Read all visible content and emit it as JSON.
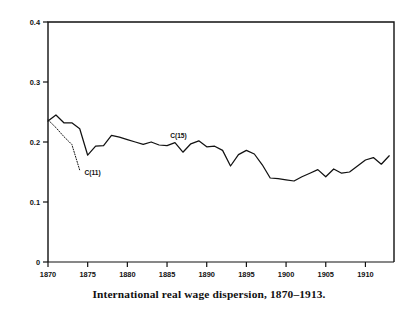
{
  "figure": {
    "caption": "International real wage dispersion, 1870–1913.",
    "axis_color": "#111111",
    "line_color": "#111111",
    "background": "#ffffff"
  },
  "chart_data": {
    "type": "line",
    "title": "",
    "subtitle": "",
    "xlabel": "",
    "ylabel": "",
    "xlim": [
      1870,
      1913.6
    ],
    "ylim": [
      0,
      0.4
    ],
    "xticks": [
      1870,
      1875,
      1880,
      1885,
      1890,
      1895,
      1900,
      1905,
      1910
    ],
    "xticklabels": [
      "1870",
      "1875",
      "1880",
      "1885",
      "1890",
      "1895",
      "1900",
      "1905",
      "1910"
    ],
    "yticks": [
      0,
      0.1,
      0.2,
      0.3,
      0.4
    ],
    "yticklabels": [
      "0",
      "0.1",
      "0.2",
      "0.3",
      "0.4"
    ],
    "grid": false,
    "legend_position": "inline-annotation",
    "annotations": [
      {
        "text": "C(11)",
        "x": 1874.6,
        "y": 0.145,
        "name": "series-label-c11"
      },
      {
        "text": "C(15)",
        "x": 1885.4,
        "y": 0.206,
        "name": "series-label-c15"
      }
    ],
    "series": [
      {
        "name": "C(15)",
        "style": "solid",
        "x": [
          1870,
          1871,
          1872,
          1873,
          1874,
          1875,
          1876,
          1877,
          1878,
          1879,
          1880,
          1881,
          1882,
          1883,
          1884,
          1885,
          1886,
          1887,
          1888,
          1889,
          1890,
          1891,
          1892,
          1893,
          1894,
          1895,
          1896,
          1897,
          1898,
          1899,
          1900,
          1901,
          1902,
          1903,
          1904,
          1905,
          1906,
          1907,
          1908,
          1909,
          1910,
          1911,
          1912,
          1913
        ],
        "values": [
          0.235,
          0.245,
          0.232,
          0.232,
          0.222,
          0.178,
          0.193,
          0.194,
          0.211,
          0.208,
          0.204,
          0.2,
          0.196,
          0.2,
          0.195,
          0.194,
          0.199,
          0.183,
          0.197,
          0.202,
          0.192,
          0.193,
          0.186,
          0.16,
          0.179,
          0.186,
          0.18,
          0.162,
          0.14,
          0.139,
          0.137,
          0.135,
          0.142,
          0.148,
          0.154,
          0.142,
          0.155,
          0.148,
          0.15,
          0.16,
          0.17,
          0.174,
          0.163,
          0.177
        ]
      },
      {
        "name": "C(11)",
        "style": "dotted",
        "x": [
          1870,
          1871,
          1872,
          1873,
          1874
        ],
        "values": [
          0.237,
          0.224,
          0.209,
          0.196,
          0.153
        ]
      }
    ]
  }
}
